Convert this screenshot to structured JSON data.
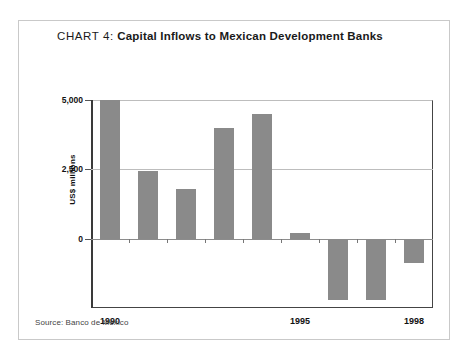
{
  "card": {
    "title_prefix": "CHART 4:",
    "title_main": "Capital Inflows to Mexican Development Banks",
    "source": "Source: Banco de México"
  },
  "chart_data": {
    "type": "bar",
    "title": "CHART 4: Capital Inflows to Mexican Development Banks",
    "xlabel": "",
    "ylabel": "US$ millions",
    "categories": [
      "1990",
      "1991",
      "1992",
      "1993",
      "1994",
      "1995",
      "1996",
      "1997",
      "1998"
    ],
    "values": [
      5000,
      2450,
      1780,
      4000,
      4500,
      200,
      -2200,
      -2200,
      -880
    ],
    "ylim": [
      -2500,
      5000
    ],
    "yticks": [
      5000,
      2500,
      0
    ],
    "ytick_labels": [
      "5,000",
      "2,500",
      "0"
    ],
    "visible_xtick_labels": [
      "1990",
      "1995",
      "1998"
    ],
    "grid": true,
    "legend": false,
    "bar_color": "#8a8a8a",
    "source": "Source: Banco de México"
  }
}
